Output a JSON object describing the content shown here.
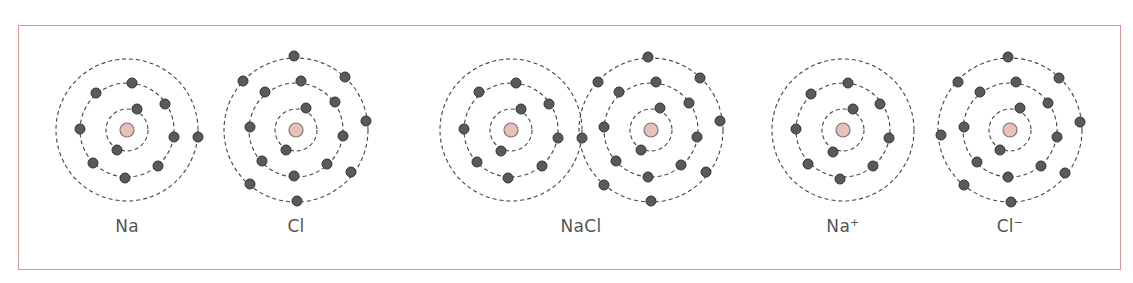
{
  "diagram": {
    "colors": {
      "frame": "#d49a9a",
      "nucleus_fill": "#e8c2b8",
      "nucleus_stroke": "#777777",
      "electron_fill": "#5a5a5a",
      "electron_stroke": "#333333",
      "shell_stroke": "#444444",
      "label": "#555555"
    },
    "items": [
      {
        "id": "na",
        "label": "Na",
        "charge": "",
        "center": [
          127,
          130
        ],
        "shells": [
          2,
          8,
          1
        ]
      },
      {
        "id": "cl",
        "label": "Cl",
        "charge": "",
        "center": [
          296,
          130
        ],
        "shells": [
          2,
          8,
          7
        ]
      },
      {
        "id": "nacl",
        "label": "NaCl",
        "charge": "",
        "atoms": [
          {
            "element": "Na",
            "center": [
              511,
              130
            ],
            "shells": [
              2,
              8,
              0
            ]
          },
          {
            "element": "Cl",
            "center": [
              651,
              130
            ],
            "shells": [
              2,
              8,
              8
            ]
          }
        ],
        "shared_electron_note": "Na valence electron at junction of outer shells"
      },
      {
        "id": "na-ion",
        "label": "Na",
        "charge": "+",
        "center": [
          843,
          130
        ],
        "shells": [
          2,
          8,
          0
        ]
      },
      {
        "id": "cl-ion",
        "label": "Cl",
        "charge": "−",
        "center": [
          1010,
          130
        ],
        "shells": [
          2,
          8,
          8
        ]
      }
    ],
    "labels": {
      "na": "Na",
      "cl": "Cl",
      "nacl": "NaCl",
      "na_ion_symbol": "Na",
      "na_ion_charge": "+",
      "cl_ion_symbol": "Cl",
      "cl_ion_charge": "−"
    }
  }
}
